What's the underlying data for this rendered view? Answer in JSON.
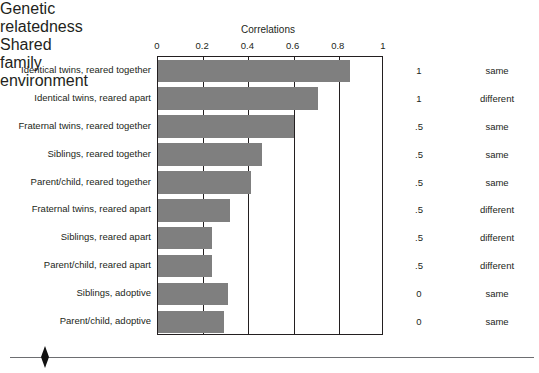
{
  "chart_data": {
    "type": "bar",
    "orientation": "horizontal",
    "title": "Correlations",
    "xlabel": "",
    "ylabel": "",
    "xlim": [
      0,
      1
    ],
    "xticks": [
      0,
      0.2,
      0.4,
      0.6,
      0.8,
      1
    ],
    "xtick_labels": [
      "0",
      "0.2",
      "0.4",
      "0.6",
      "0.8",
      "1"
    ],
    "grid": true,
    "legend": "none",
    "bar_color": "#7f7f7f",
    "axis_color": "#231f20",
    "categories": [
      "Identical twins, reared together",
      "Identical twins, reared apart",
      "Fraternal twins, reared together",
      "Siblings, reared together",
      "Parent/child, reared together",
      "Fraternal twins, reared apart",
      "Siblings, reared apart",
      "Parent/child, reared apart",
      "Siblings, adoptive",
      "Parent/child, adoptive"
    ],
    "values": [
      0.85,
      0.71,
      0.6,
      0.46,
      0.41,
      0.32,
      0.24,
      0.24,
      0.31,
      0.29
    ]
  },
  "headers": {
    "genetic": "Genetic\nrelatedness",
    "genetic_line1": "Genetic",
    "genetic_line2": "relatedness",
    "shared_line1": "Shared family",
    "shared_line2": "environment"
  },
  "rows": [
    {
      "label": "Identical twins, reared together",
      "value": 0.85,
      "genetic": "1",
      "shared": "same"
    },
    {
      "label": "Identical twins, reared apart",
      "value": 0.71,
      "genetic": "1",
      "shared": "different"
    },
    {
      "label": "Fraternal twins, reared together",
      "value": 0.6,
      "genetic": ".5",
      "shared": "same"
    },
    {
      "label": "Siblings, reared together",
      "value": 0.46,
      "genetic": ".5",
      "shared": "same"
    },
    {
      "label": "Parent/child, reared together",
      "value": 0.41,
      "genetic": ".5",
      "shared": "same"
    },
    {
      "label": "Fraternal twins, reared apart",
      "value": 0.32,
      "genetic": ".5",
      "shared": "different"
    },
    {
      "label": "Siblings, reared apart",
      "value": 0.24,
      "genetic": ".5",
      "shared": "different"
    },
    {
      "label": "Parent/child, reared apart",
      "value": 0.24,
      "genetic": ".5",
      "shared": "different"
    },
    {
      "label": "Siblings, adoptive",
      "value": 0.31,
      "genetic": "0",
      "shared": "same"
    },
    {
      "label": "Parent/child, adoptive",
      "value": 0.29,
      "genetic": "0",
      "shared": "same"
    }
  ],
  "ornament": {
    "diamond": "diamond-ornament",
    "rule_color": "#6d6e71"
  }
}
